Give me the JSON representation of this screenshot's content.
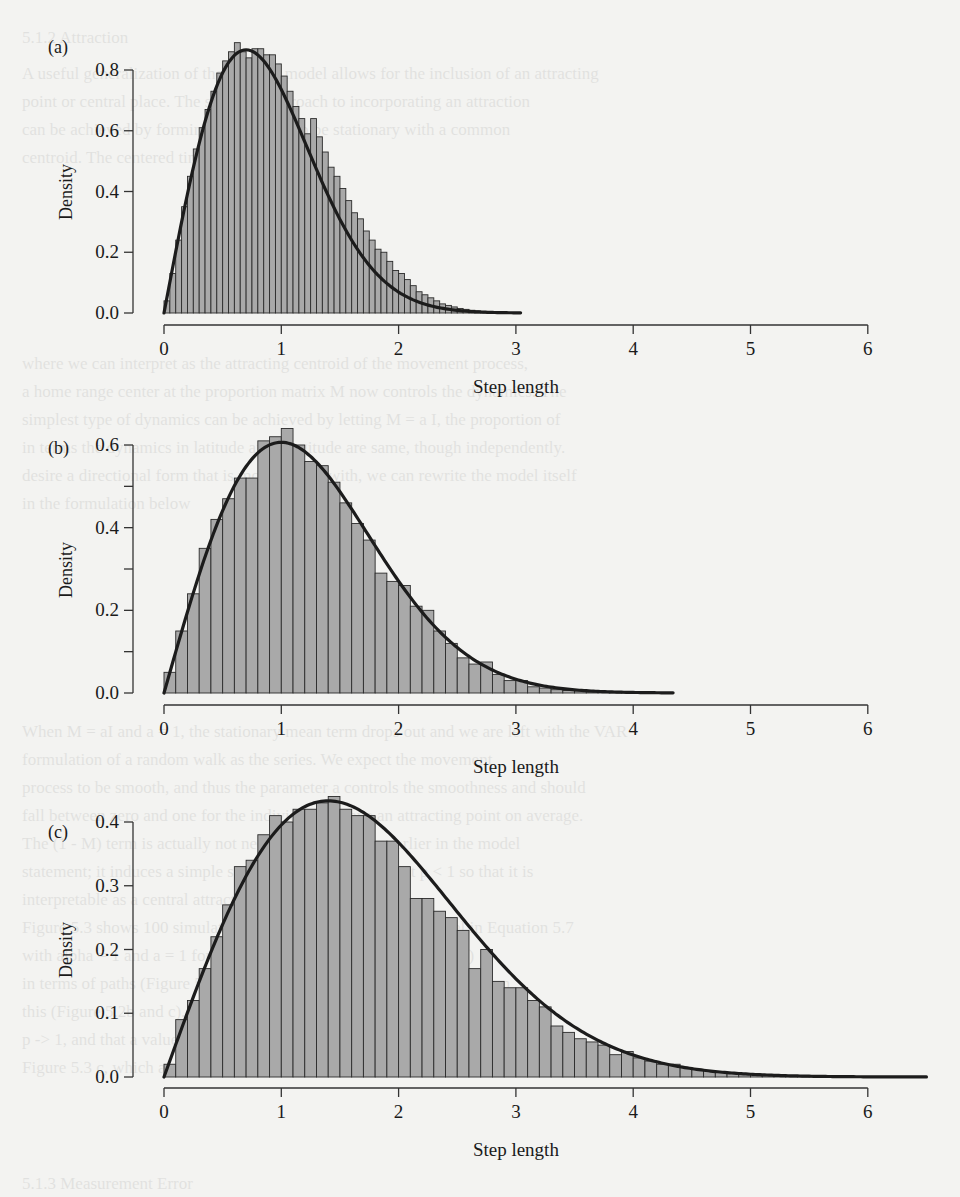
{
  "page": {
    "background_color": "#f3f3f1",
    "bar_fill": "#a9a9a9",
    "bar_stroke": "#2b2b2b",
    "curve_color": "#1c1c1c",
    "axis_color": "#333333",
    "bleed_through_text": [
      {
        "y": 24,
        "x": 22,
        "text": "5.1.2   Attraction"
      },
      {
        "y": 60,
        "x": 22,
        "text": "A useful generalization of the VAR(1) model allows for the inclusion of an attracting"
      },
      {
        "y": 88,
        "x": 22,
        "text": "point or central place. The simplest approach to incorporating an attraction"
      },
      {
        "y": 116,
        "x": 22,
        "text": "can be achieved by forming the process to be stationary with a common"
      },
      {
        "y": 144,
        "x": 22,
        "text": "centroid. The centered time series"
      },
      {
        "y": 350,
        "x": 22,
        "text": "where we can interpret as the attracting centroid of the movement process,"
      },
      {
        "y": 378,
        "x": 22,
        "text": "a home range center at the proportion matrix M now controls the dynamics. The"
      },
      {
        "y": 406,
        "x": 22,
        "text": "simplest type of dynamics can be achieved by letting M = a I, the proportion of"
      },
      {
        "y": 434,
        "x": 22,
        "text": "in terms the dynamics in latitude and longitude are same, though independently."
      },
      {
        "y": 462,
        "x": 22,
        "text": "desire a directional form that is more typical with, we can rewrite the model itself"
      },
      {
        "y": 490,
        "x": 22,
        "text": "in the formulation below"
      },
      {
        "y": 718,
        "x": 22,
        "text": "When M = aI and a = 1, the stationary mean term drops out and we are left with the VAR"
      },
      {
        "y": 746,
        "x": 22,
        "text": "formulation of a random walk as the series. We expect the movement"
      },
      {
        "y": 774,
        "x": 22,
        "text": "process to be smooth, and thus the parameter a controls the smoothness and should"
      },
      {
        "y": 802,
        "x": 22,
        "text": "fall between zero and one for the individual to have an attracting point on average."
      },
      {
        "y": 830,
        "x": 22,
        "text": "The (1 - M) term is actually not necessary, as we saw earlier in the model"
      },
      {
        "y": 858,
        "x": 22,
        "text": "statement; it induces a simple stability. It is necessary that p < 1 so that it is"
      },
      {
        "y": 886,
        "x": 22,
        "text": "interpretable as a central attraction term."
      },
      {
        "y": 914,
        "x": 22,
        "text": "Figure 5.3 shows 100 simulated VAR trajectories from the model in Equation 5.7"
      },
      {
        "y": 942,
        "x": 22,
        "text": "with alpha = 1 and a = 1 for values of the parameters (Figure 5.2a)"
      },
      {
        "y": 970,
        "x": 22,
        "text": "in terms of paths (Figure 5.2b and c) and the step lengths resulting from"
      },
      {
        "y": 998,
        "x": 22,
        "text": "this (Figure 5.2b and c). Notice that the spread of the steps increases as a"
      },
      {
        "y": 1026,
        "x": 22,
        "text": "p -> 1, and that a value of alpha near one concentrates the steps, as in"
      },
      {
        "y": 1054,
        "x": 22,
        "text": "Figure 5.3 c, which approaches the classic random walk."
      },
      {
        "y": 1170,
        "x": 22,
        "text": "5.1.3   Measurement Error"
      }
    ]
  },
  "chart_data": [
    {
      "type": "bar",
      "panel_label": "(a)",
      "title": "",
      "xlabel": "Step length",
      "ylabel": "Density",
      "xlim": [
        0,
        6
      ],
      "ylim": [
        0,
        0.8
      ],
      "x_ticks": [
        "0",
        "1",
        "2",
        "3",
        "4",
        "5",
        "6"
      ],
      "y_ticks": [
        "0.0",
        "0.2",
        "0.4",
        "0.6",
        "0.8"
      ],
      "y_minor_ticks": [],
      "grid": false,
      "legend": null,
      "bin_width": 0.05,
      "bin_start": 0,
      "values": [
        0.04,
        0.13,
        0.24,
        0.35,
        0.45,
        0.54,
        0.61,
        0.67,
        0.73,
        0.79,
        0.83,
        0.86,
        0.89,
        0.86,
        0.84,
        0.87,
        0.87,
        0.85,
        0.85,
        0.82,
        0.78,
        0.73,
        0.68,
        0.64,
        0.59,
        0.64,
        0.58,
        0.53,
        0.48,
        0.45,
        0.41,
        0.37,
        0.33,
        0.31,
        0.27,
        0.24,
        0.21,
        0.2,
        0.17,
        0.14,
        0.13,
        0.11,
        0.09,
        0.07,
        0.06,
        0.05,
        0.04,
        0.03,
        0.025,
        0.02,
        0.015,
        0.012,
        0.009,
        0.007,
        0.005,
        0.004,
        0.003,
        0.002,
        0.001,
        0.001
      ],
      "fitted_curve": {
        "family": "rayleigh",
        "sigma": 0.7,
        "x_max": 3.05,
        "peak_x": 0.7,
        "peak_y": 0.866
      }
    },
    {
      "type": "bar",
      "panel_label": "(b)",
      "title": "",
      "xlabel": "Step length",
      "ylabel": "Density",
      "xlim": [
        0,
        6
      ],
      "ylim": [
        0,
        0.6
      ],
      "x_ticks": [
        "0",
        "1",
        "2",
        "3",
        "4",
        "5",
        "6"
      ],
      "y_ticks": [
        "0.0",
        "0.2",
        "0.4",
        "0.6"
      ],
      "y_minor_ticks": [
        0.1,
        0.3,
        0.5
      ],
      "grid": false,
      "legend": null,
      "bin_width": 0.1,
      "bin_start": 0,
      "values": [
        0.05,
        0.15,
        0.24,
        0.35,
        0.42,
        0.47,
        0.52,
        0.52,
        0.61,
        0.62,
        0.64,
        0.6,
        0.56,
        0.55,
        0.51,
        0.46,
        0.41,
        0.37,
        0.29,
        0.27,
        0.26,
        0.21,
        0.2,
        0.15,
        0.12,
        0.085,
        0.07,
        0.075,
        0.045,
        0.03,
        0.03,
        0.015,
        0.012,
        0.008,
        0.006,
        0.005,
        0.003,
        0.002,
        0.001,
        0.001
      ],
      "fitted_curve": {
        "family": "rayleigh",
        "sigma": 1.0,
        "x_max": 4.35,
        "peak_x": 1.0,
        "peak_y": 0.607
      }
    },
    {
      "type": "bar",
      "panel_label": "(c)",
      "title": "",
      "xlabel": "Step length",
      "ylabel": "Density",
      "xlim": [
        0,
        6
      ],
      "ylim": [
        0,
        0.4
      ],
      "x_ticks": [
        "0",
        "1",
        "2",
        "3",
        "4",
        "5",
        "6"
      ],
      "y_ticks": [
        "0.0",
        "0.1",
        "0.2",
        "0.3",
        "0.4"
      ],
      "y_minor_ticks": [],
      "grid": false,
      "legend": null,
      "bin_width": 0.1,
      "bin_start": 0,
      "values": [
        0.02,
        0.09,
        0.12,
        0.17,
        0.22,
        0.27,
        0.33,
        0.34,
        0.38,
        0.41,
        0.4,
        0.42,
        0.42,
        0.43,
        0.44,
        0.42,
        0.41,
        0.41,
        0.37,
        0.37,
        0.33,
        0.28,
        0.28,
        0.26,
        0.25,
        0.23,
        0.17,
        0.2,
        0.15,
        0.14,
        0.14,
        0.12,
        0.11,
        0.08,
        0.07,
        0.06,
        0.055,
        0.05,
        0.035,
        0.04,
        0.03,
        0.025,
        0.02,
        0.02,
        0.015,
        0.012,
        0.01,
        0.008,
        0.006,
        0.005,
        0.004,
        0.003,
        0.002,
        0.002,
        0.001,
        0.001
      ],
      "fitted_curve": {
        "family": "rayleigh",
        "sigma": 1.4,
        "x_max": 6.5,
        "peak_x": 1.4,
        "peak_y": 0.433
      }
    }
  ]
}
